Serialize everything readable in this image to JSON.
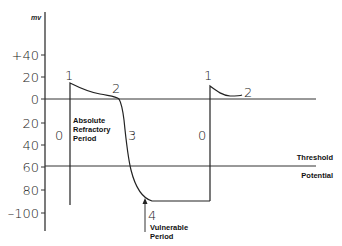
{
  "diagram": {
    "axis": {
      "unit": "mv",
      "ticks": [
        {
          "label": "+40",
          "y": 55
        },
        {
          "label": "20",
          "y": 77
        },
        {
          "label": "0",
          "y": 99
        },
        {
          "label": "20",
          "y": 123
        },
        {
          "label": "40",
          "y": 145
        },
        {
          "label": "60",
          "y": 167
        },
        {
          "label": "80",
          "y": 190
        },
        {
          "label": "–100",
          "y": 213
        }
      ]
    },
    "phases": {
      "p1_first": "1",
      "p2_first": "2",
      "p0_first": "0",
      "p3": "3",
      "p4": "4",
      "p1_second": "1",
      "p2_second": "2",
      "p0_second": "0"
    },
    "annotations": {
      "absolute_refractory": [
        "Absolute",
        "Refractory",
        "Period"
      ],
      "vulnerable": [
        "Vulnerable",
        "Period"
      ],
      "threshold": "Threshold",
      "potential": "Potential"
    },
    "colors": {
      "ink": "#222222",
      "background": "#ffffff"
    }
  }
}
